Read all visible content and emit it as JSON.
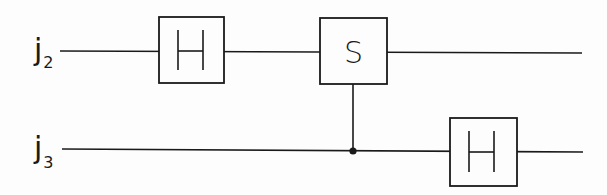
{
  "circuit": {
    "qubits": [
      {
        "label": "j",
        "subscript": "2"
      },
      {
        "label": "j",
        "subscript": "3"
      }
    ],
    "gates": [
      {
        "name": "H",
        "qubit": 0,
        "label": "H"
      },
      {
        "name": "S",
        "qubit": 0,
        "label": "S",
        "control": 1
      },
      {
        "name": "H",
        "qubit": 1,
        "label": "H"
      }
    ]
  },
  "colors": {
    "line": "#1a1a1a",
    "background": "#fdfdfd"
  }
}
